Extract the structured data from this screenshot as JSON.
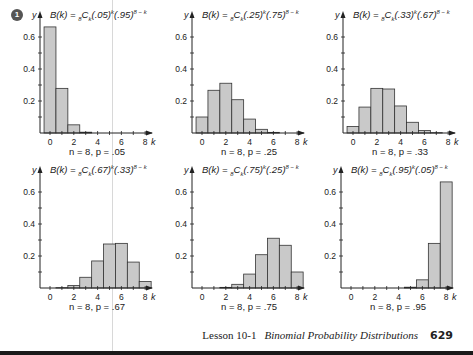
{
  "marker": "1",
  "footer": {
    "lesson": "Lesson 10-1",
    "title": "Binomial Probability Distributions",
    "page": "629"
  },
  "charts": [
    {
      "p_label": ".05",
      "q_label": ".95",
      "caption": "n = 8, p = .05"
    },
    {
      "p_label": ".25",
      "q_label": ".75",
      "caption": "n = 8, p = .25"
    },
    {
      "p_label": ".33",
      "q_label": ".67",
      "caption": "n = 8, p = .33"
    },
    {
      "p_label": ".67",
      "q_label": ".33",
      "caption": "n = 8, p = .67"
    },
    {
      "p_label": ".75",
      "q_label": ".25",
      "caption": "n = 8, p = .75"
    },
    {
      "p_label": ".95",
      "q_label": ".05",
      "caption": "n = 8, p = .95"
    }
  ],
  "chart_data": [
    {
      "type": "bar",
      "title": "B(k) = 8Ck(.05)^k(.95)^(8-k)",
      "subtitle": "n = 8, p = .05",
      "xlabel": "k",
      "ylabel": "y",
      "categories": [
        0,
        1,
        2,
        3,
        4,
        5,
        6,
        7,
        8
      ],
      "values": [
        0.663,
        0.279,
        0.051,
        0.005,
        0.0,
        0.0,
        0.0,
        0.0,
        0.0
      ],
      "x_ticks": [
        0,
        2,
        4,
        6,
        8
      ],
      "y_ticks": [
        0.2,
        0.4,
        0.6
      ],
      "ylim": [
        0,
        0.7
      ],
      "grid": false
    },
    {
      "type": "bar",
      "title": "B(k) = 8Ck(.25)^k(.75)^(8-k)",
      "subtitle": "n = 8, p = .25",
      "xlabel": "k",
      "ylabel": "y",
      "categories": [
        0,
        1,
        2,
        3,
        4,
        5,
        6,
        7,
        8
      ],
      "values": [
        0.1,
        0.267,
        0.311,
        0.208,
        0.087,
        0.023,
        0.004,
        0.0,
        0.0
      ],
      "x_ticks": [
        0,
        2,
        4,
        6,
        8
      ],
      "y_ticks": [
        0.2,
        0.4,
        0.6
      ],
      "ylim": [
        0,
        0.7
      ],
      "grid": false
    },
    {
      "type": "bar",
      "title": "B(k) = 8Ck(.33)^k(.67)^(8-k)",
      "subtitle": "n = 8, p = .33",
      "xlabel": "k",
      "ylabel": "y",
      "categories": [
        0,
        1,
        2,
        3,
        4,
        5,
        6,
        7,
        8
      ],
      "values": [
        0.041,
        0.162,
        0.279,
        0.275,
        0.169,
        0.067,
        0.016,
        0.002,
        0.0
      ],
      "x_ticks": [
        0,
        2,
        4,
        6,
        8
      ],
      "y_ticks": [
        0.2,
        0.4,
        0.6
      ],
      "ylim": [
        0,
        0.7
      ],
      "grid": false
    },
    {
      "type": "bar",
      "title": "B(k) = 8Ck(.67)^k(.33)^(8-k)",
      "subtitle": "n = 8, p = .67",
      "xlabel": "k",
      "ylabel": "y",
      "categories": [
        0,
        1,
        2,
        3,
        4,
        5,
        6,
        7,
        8
      ],
      "values": [
        0.0,
        0.002,
        0.016,
        0.067,
        0.169,
        0.275,
        0.279,
        0.162,
        0.041
      ],
      "x_ticks": [
        0,
        2,
        4,
        6,
        8
      ],
      "y_ticks": [
        0.2,
        0.4,
        0.6
      ],
      "ylim": [
        0,
        0.7
      ],
      "grid": false
    },
    {
      "type": "bar",
      "title": "B(k) = 8Ck(.75)^k(.25)^(8-k)",
      "subtitle": "n = 8, p = .75",
      "xlabel": "k",
      "ylabel": "y",
      "categories": [
        0,
        1,
        2,
        3,
        4,
        5,
        6,
        7,
        8
      ],
      "values": [
        0.0,
        0.0,
        0.004,
        0.023,
        0.087,
        0.208,
        0.311,
        0.267,
        0.1
      ],
      "x_ticks": [
        0,
        2,
        4,
        6,
        8
      ],
      "y_ticks": [
        0.2,
        0.4,
        0.6
      ],
      "ylim": [
        0,
        0.7
      ],
      "grid": false
    },
    {
      "type": "bar",
      "title": "B(k) = 8Ck(.95)^k(.05)^(8-k)",
      "subtitle": "n = 8, p = .95",
      "xlabel": "k",
      "ylabel": "y",
      "categories": [
        0,
        1,
        2,
        3,
        4,
        5,
        6,
        7,
        8
      ],
      "values": [
        0.0,
        0.0,
        0.0,
        0.0,
        0.0,
        0.005,
        0.051,
        0.279,
        0.663
      ],
      "x_ticks": [
        0,
        2,
        4,
        6,
        8
      ],
      "y_ticks": [
        0.2,
        0.4,
        0.6
      ],
      "ylim": [
        0,
        0.7
      ],
      "grid": false
    }
  ]
}
